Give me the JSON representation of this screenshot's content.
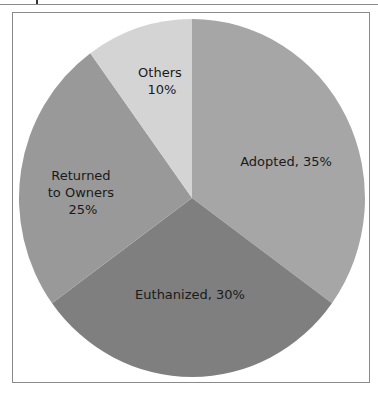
{
  "chart_data": {
    "type": "pie",
    "title": "",
    "categories": [
      "Adopted",
      "Euthanized",
      "Returned to Owners",
      "Others"
    ],
    "values": [
      35,
      30,
      25,
      10
    ],
    "unit": "%",
    "labels": [
      {
        "line1": "Adopted, 35%",
        "line2": "",
        "line3": ""
      },
      {
        "line1": "Euthanized, 30%",
        "line2": "",
        "line3": ""
      },
      {
        "line1": "Returned",
        "line2": "to Owners",
        "line3": "25%"
      },
      {
        "line1": "Others",
        "line2": "10%",
        "line3": ""
      }
    ],
    "colors": [
      "#a6a6a6",
      "#7f7f7f",
      "#999999",
      "#d4d4d4"
    ],
    "start_angle": "12 o'clock, clockwise",
    "legend": "none (labels inside slices)"
  }
}
